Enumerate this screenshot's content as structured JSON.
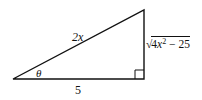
{
  "diagram": {
    "type": "right-triangle",
    "vertices": {
      "left": {
        "x": 13,
        "y": 79
      },
      "top_right": {
        "x": 144,
        "y": 10
      },
      "right_angle": {
        "x": 144,
        "y": 79
      }
    },
    "right_angle_marker_size": 9,
    "stroke_color": "#111111",
    "labels": {
      "hypotenuse": {
        "var": "2x"
      },
      "angle": "θ",
      "adjacent": "5",
      "opposite": {
        "radical_sign": "√",
        "coefficient": "4",
        "variable": "x",
        "exponent": "2",
        "rest": " − 25"
      }
    }
  }
}
